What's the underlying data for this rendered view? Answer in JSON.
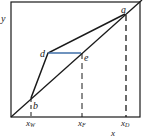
{
  "axes": {
    "y_label": "y",
    "x_label": "x"
  },
  "points": {
    "a": "a",
    "b": "b",
    "d": "d",
    "e": "e"
  },
  "ticks": {
    "xw_main": "x",
    "xw_sub": "W",
    "xf_main": "x",
    "xf_sub": "F",
    "xd_main": "x",
    "xd_sub": "D"
  },
  "colors": {
    "line": "#1a1a1a",
    "de_segment": "#3f6fa8"
  }
}
